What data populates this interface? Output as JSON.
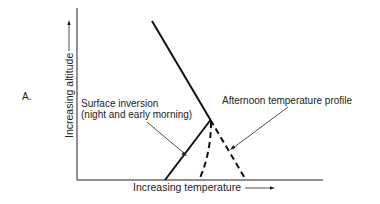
{
  "figure": {
    "panel_label": "A.",
    "y_axis_label": "Increasing altitude",
    "x_axis_label": "Increasing temperature",
    "annotations": {
      "surface_inversion_line1": "Surface inversion",
      "surface_inversion_line2": "(night and early morning)",
      "afternoon_profile": "Afternoon temperature profile"
    },
    "line_styles": {
      "surface_inversion": "solid",
      "afternoon_profile": "dashed"
    }
  }
}
